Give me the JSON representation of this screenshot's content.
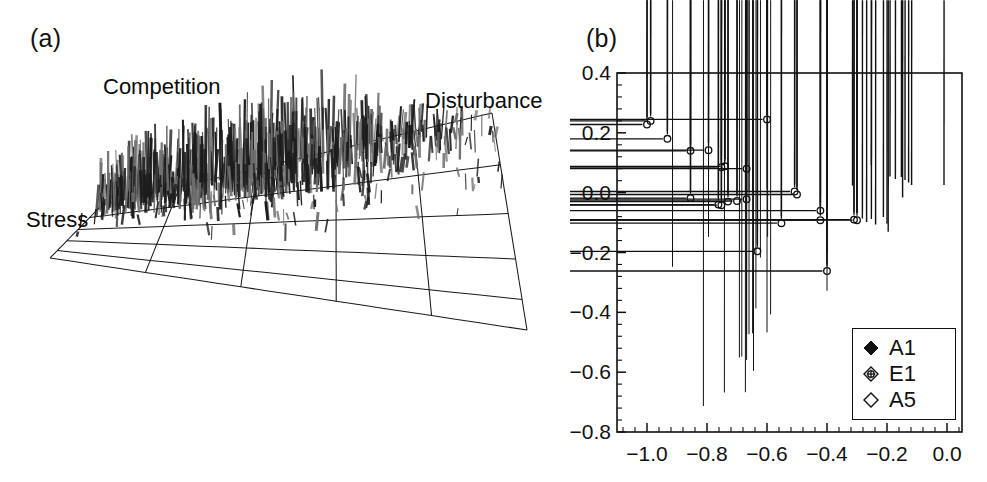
{
  "figure": {
    "panels": [
      {
        "tag": "(a)",
        "type": "3d-surface-spikes"
      },
      {
        "tag": "(b)",
        "type": "scatter"
      }
    ]
  },
  "panel_a": {
    "tag": "(a)",
    "labels": {
      "competition": "Competition",
      "disturbance": "Disturbance",
      "stress": "Stress"
    },
    "grid": {
      "rows": 5,
      "cols": 5,
      "line_color": "#1a1a1a"
    },
    "spike_color_dark": "#1c1c1c",
    "spike_color_mid": "#6e6e6e"
  },
  "chart_data": {
    "type": "scatter",
    "title": "",
    "subtitle": "",
    "xlabel": "",
    "ylabel": "",
    "xlim": [
      -1.1,
      0.05
    ],
    "ylim": [
      -0.8,
      0.4
    ],
    "xticks": [
      -1.0,
      -0.8,
      -0.6,
      -0.4,
      -0.2,
      0.0
    ],
    "xticklabels": [
      "−1.0",
      "−0.8",
      "−0.6",
      "−0.4",
      "−0.2",
      "0.0"
    ],
    "yticks": [
      0.4,
      0.2,
      0.0,
      -0.2,
      -0.4,
      -0.6,
      -0.8
    ],
    "yticklabels": [
      "0.4",
      "0.2",
      "0.0",
      "−0.2",
      "−0.4",
      "−0.6",
      "−0.8"
    ],
    "minor_ticks_per_interval": 4,
    "grid": false,
    "legend_position": "lower-right",
    "marker_color": "#111111",
    "series": [
      {
        "name": "A1",
        "marker": "filled-diamond",
        "points": [
          [
            -0.795,
            -0.08
          ],
          [
            -0.795,
            -0.172
          ],
          [
            -0.915,
            -0.272
          ],
          [
            -0.672,
            -0.022
          ],
          [
            -0.66,
            -0.022
          ],
          [
            -0.648,
            -0.022
          ],
          [
            -0.6,
            -0.011
          ],
          [
            -0.598,
            -0.172
          ],
          [
            -0.622,
            -0.241
          ],
          [
            -0.4,
            -0.222
          ],
          [
            -0.4,
            -0.352
          ],
          [
            -0.637,
            -0.411
          ],
          [
            -0.588,
            -0.431
          ],
          [
            -0.668,
            -0.497
          ],
          [
            -0.66,
            -0.497
          ],
          [
            -0.648,
            -0.494
          ],
          [
            -0.6,
            -0.491
          ],
          [
            -0.692,
            -0.575
          ],
          [
            -0.684,
            -0.572
          ],
          [
            -0.668,
            -0.583
          ],
          [
            -0.645,
            -0.62
          ],
          [
            -0.742,
            -0.692
          ],
          [
            -0.672,
            -0.691
          ],
          [
            -0.812,
            -0.737
          ]
        ]
      },
      {
        "name": "E1",
        "marker": "crossed-diamond",
        "points": [
          [
            -1.0,
            0.228
          ],
          [
            -0.988,
            0.24
          ],
          [
            -0.932,
            0.18
          ],
          [
            -0.6,
            0.245
          ],
          [
            -0.855,
            0.14
          ],
          [
            -0.795,
            0.142
          ],
          [
            -0.752,
            0.085
          ],
          [
            -0.74,
            0.088
          ],
          [
            -0.668,
            0.08
          ],
          [
            -0.855,
            -0.018
          ],
          [
            -0.762,
            -0.04
          ],
          [
            -0.752,
            -0.042
          ],
          [
            -0.73,
            -0.03
          ],
          [
            -0.7,
            -0.028
          ],
          [
            -0.668,
            -0.022
          ],
          [
            -0.508,
            0.004
          ],
          [
            -0.5,
            -0.006
          ],
          [
            -0.552,
            -0.102
          ],
          [
            -0.422,
            -0.06
          ],
          [
            -0.422,
            -0.092
          ],
          [
            -0.31,
            -0.09
          ],
          [
            -0.3,
            -0.092
          ],
          [
            -0.632,
            -0.196
          ],
          [
            -0.4,
            -0.262
          ]
        ]
      },
      {
        "name": "A5",
        "marker": "open-diamond",
        "points": [
          [
            -0.252,
            0.068
          ],
          [
            -0.315,
            0.0
          ],
          [
            -0.19,
            0.03
          ],
          [
            -0.172,
            0.022
          ],
          [
            -0.152,
            0.028
          ],
          [
            -0.14,
            0.018
          ],
          [
            -0.128,
            0.01
          ],
          [
            -0.118,
            0.002
          ],
          [
            -0.148,
            -0.04
          ],
          [
            -0.01,
            0.002
          ],
          [
            -0.3,
            -0.092
          ],
          [
            -0.282,
            -0.11
          ],
          [
            -0.268,
            -0.122
          ],
          [
            -0.252,
            -0.112
          ],
          [
            -0.238,
            -0.13
          ],
          [
            -0.212,
            -0.105
          ],
          [
            -0.2,
            -0.128
          ],
          [
            -0.196,
            -0.155
          ]
        ]
      }
    ],
    "legend": [
      {
        "label": "A1",
        "marker": "filled-diamond"
      },
      {
        "label": "E1",
        "marker": "crossed-diamond"
      },
      {
        "label": "A5",
        "marker": "open-diamond"
      }
    ]
  }
}
